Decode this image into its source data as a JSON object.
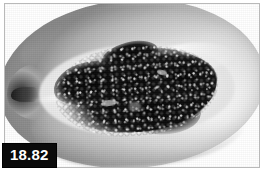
{
  "figure": {
    "number": "18.82",
    "label_text_color": "#ffffff",
    "label_background_color": "#0a0a0a"
  },
  "photo": {
    "subject": "papaya-fruit-longitudinal-half",
    "description": "Grayscale photograph of a papaya cut lengthwise showing the pale flesh and the dark seed mass filling the central cavity",
    "frame_border_color": "#b9b9b9",
    "background_color": "#ffffff",
    "flesh_tone": "#e2e2e2",
    "seed_tone": "#0b0b0b",
    "highlight_tone": "#ffffff"
  }
}
